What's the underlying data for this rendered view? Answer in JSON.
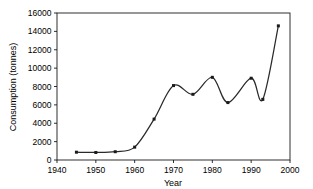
{
  "chart_data": {
    "type": "line",
    "title": "",
    "xlabel": "Year",
    "ylabel": "Consumption (tonnes)",
    "xlim": [
      1940,
      2000
    ],
    "ylim": [
      0,
      16000
    ],
    "xticks": [
      1940,
      1950,
      1960,
      1970,
      1980,
      1990,
      2000
    ],
    "xtick_labels": [
      "1940",
      "1950",
      "1960",
      "1970",
      "1980",
      "1990",
      "2000"
    ],
    "yticks": [
      0,
      2000,
      4000,
      6000,
      8000,
      10000,
      12000,
      14000,
      16000
    ],
    "ytick_labels": [
      "0",
      "2000",
      "4000",
      "6000",
      "8000",
      "10000",
      "12000",
      "14000",
      "16000"
    ],
    "grid": false,
    "legend": false,
    "line_color": "#2a2a2a",
    "marker": "square",
    "smoothing": "spline",
    "x": [
      1945,
      1950,
      1955,
      1960,
      1965,
      1970,
      1975,
      1980,
      1984,
      1990,
      1993,
      1997
    ],
    "values": [
      850,
      820,
      900,
      1400,
      4450,
      8100,
      7150,
      9000,
      6250,
      8900,
      6600,
      14600
    ],
    "series": [
      {
        "name": "Consumption",
        "values": [
          850,
          820,
          900,
          1400,
          4450,
          8100,
          7150,
          9000,
          6250,
          8900,
          6600,
          14600
        ]
      }
    ]
  },
  "axes": {
    "x_title": "Year",
    "y_title": "Consumption (tonnes)"
  }
}
